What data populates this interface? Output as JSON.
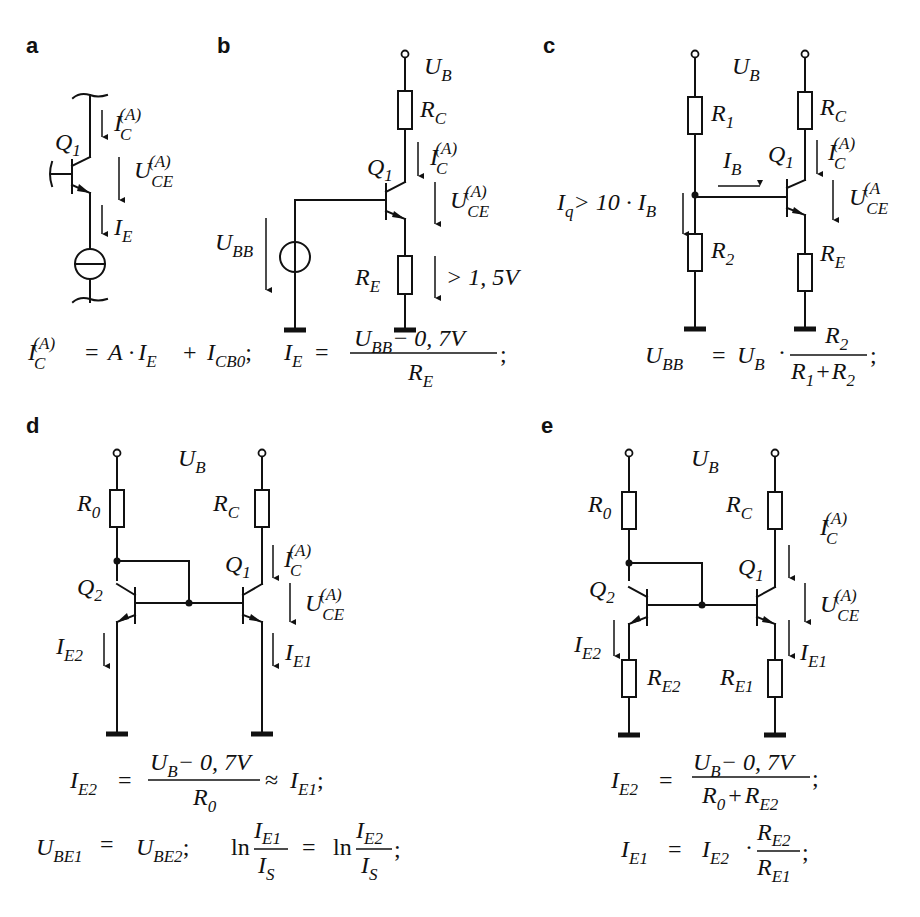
{
  "figure": {
    "panels": [
      {
        "id": "a",
        "label": "a"
      },
      {
        "id": "b",
        "label": "b"
      },
      {
        "id": "c",
        "label": "c"
      },
      {
        "id": "d",
        "label": "d"
      },
      {
        "id": "e",
        "label": "e"
      }
    ],
    "symbols": {
      "I": "I",
      "U": "U",
      "R": "R",
      "Q": "Q",
      "A": "A",
      "sub_C": "C",
      "sub_E": "E",
      "sub_B": "B",
      "sub_BB": "BB",
      "sub_CE": "CE",
      "sub_1": "1",
      "sub_2": "2",
      "sub_0": "0",
      "sub_q": "q",
      "sub_S": "S",
      "sub_E1": "E1",
      "sub_E2": "E2",
      "sub_BE1": "BE1",
      "sub_BE2": "BE2",
      "sub_CB0": "CB0",
      "sup_A": "(A)",
      "sup_A_clipped": "(A"
    },
    "a": {
      "transistor": "Q",
      "transistor_sub": "1",
      "ic_label": "I",
      "uce_label": "U",
      "ie_label": "I"
    },
    "b": {
      "supply": "U",
      "supply_sub": "B",
      "rc": "R",
      "re": "R",
      "source": "U",
      "source_sub": "BB",
      "re_voltage": "> 1, 5V"
    },
    "c": {
      "iq_text": "> 10 · ",
      "formula": "U_BB = U_B · R_2 / (R_1 + R_2);"
    },
    "formulas": {
      "ab_line": {
        "eq": "=",
        "a_dot": "A ·",
        "plus": "+",
        "sep": ";",
        "frac_num_tail": "− 0, 7V",
        "end": ";"
      },
      "c_line": {
        "eq": "=",
        "dot": "·",
        "plus": "+",
        "end": ";"
      },
      "d_line1": {
        "eq": "=",
        "num_tail": "− 0, 7V",
        "approx": "≈",
        "end": ";"
      },
      "d_line2": {
        "eq": "=",
        "sep": ";",
        "ln": "ln",
        "end": ";"
      },
      "e_line1": {
        "eq": "=",
        "num_tail": "− 0, 7V",
        "plus": "+",
        "end": ";"
      },
      "e_line2": {
        "eq": "=",
        "dot": "·",
        "end": ";"
      }
    },
    "icons": {
      "current_source": "current-source-icon",
      "voltage_source": "voltage-source-icon",
      "ground": "ground-icon",
      "resistor": "resistor-icon",
      "npn_transistor": "npn-transistor-icon",
      "terminal": "supply-terminal-icon",
      "junction": "junction-dot-icon",
      "arrow": "down-arrow-icon"
    }
  }
}
